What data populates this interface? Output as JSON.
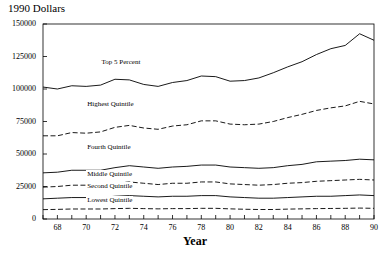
{
  "chart_data": {
    "type": "line",
    "title": "",
    "ylabel": "1990 Dollars",
    "xlabel": "Year",
    "xlim": [
      67,
      90
    ],
    "ylim": [
      0,
      150000
    ],
    "grid": false,
    "legend_position": "inline-labels",
    "xticks": [
      "68",
      "70",
      "72",
      "74",
      "76",
      "78",
      "80",
      "82",
      "84",
      "86",
      "88",
      "90"
    ],
    "xtick_values": [
      68,
      70,
      72,
      74,
      76,
      78,
      80,
      82,
      84,
      86,
      88,
      90
    ],
    "yticks": [
      "0",
      "25000",
      "50000",
      "75000",
      "100000",
      "125000",
      "150000"
    ],
    "ytick_values": [
      0,
      25000,
      50000,
      75000,
      100000,
      125000,
      150000
    ],
    "x": [
      67,
      68,
      69,
      70,
      71,
      72,
      73,
      74,
      75,
      76,
      77,
      78,
      79,
      80,
      81,
      82,
      83,
      84,
      85,
      86,
      87,
      88,
      89,
      90
    ],
    "series": [
      {
        "name": "Top 5 Percent",
        "style": "solid",
        "color": "#000000",
        "label_x": 71,
        "label_y": 120000,
        "values": [
          101500,
          100000,
          102500,
          102000,
          103000,
          107500,
          107000,
          103500,
          102000,
          105000,
          106500,
          110000,
          109500,
          106000,
          106500,
          108500,
          112500,
          117000,
          121000,
          126500,
          131000,
          133500,
          142500,
          137500
        ]
      },
      {
        "name": "Highest Quintile",
        "style": "dashed",
        "color": "#000000",
        "label_x": 70,
        "label_y": 88000,
        "values": [
          64000,
          64000,
          66500,
          66000,
          67000,
          70500,
          72000,
          70000,
          69000,
          71500,
          72500,
          75500,
          75500,
          73000,
          72500,
          73000,
          75000,
          78000,
          80500,
          83500,
          85500,
          87000,
          90500,
          88500
        ]
      },
      {
        "name": "Fourth Quintile",
        "style": "solid",
        "color": "#000000",
        "label_x": 70,
        "label_y": 55000,
        "values": [
          35500,
          36000,
          37500,
          37500,
          37500,
          39500,
          41000,
          40000,
          39000,
          40000,
          40500,
          41500,
          41500,
          40000,
          39500,
          39000,
          39500,
          41000,
          42000,
          44000,
          44500,
          45000,
          46000,
          45500
        ]
      },
      {
        "name": "Middle Quintile",
        "style": "dashed",
        "color": "#000000",
        "label_x": 70,
        "label_y": 33500,
        "values": [
          24500,
          25000,
          26000,
          26000,
          26000,
          27500,
          28500,
          27500,
          26500,
          27500,
          27500,
          28500,
          28500,
          27000,
          26500,
          26000,
          26500,
          27500,
          28000,
          29000,
          29500,
          30000,
          30500,
          30000
        ]
      },
      {
        "name": "Second Quintile",
        "style": "solid",
        "color": "#000000",
        "label_x": 70,
        "label_y": 25000,
        "values": [
          15500,
          16000,
          16500,
          16500,
          16500,
          17500,
          18000,
          17500,
          17000,
          17500,
          17500,
          18000,
          18000,
          17000,
          16500,
          16000,
          16000,
          16500,
          17000,
          17500,
          17500,
          18000,
          18500,
          18000
        ]
      },
      {
        "name": "Lowest Quintile",
        "style": "dashed",
        "color": "#000000",
        "label_x": 70,
        "label_y": 13500,
        "values": [
          7200,
          7400,
          7700,
          7700,
          7700,
          8000,
          8200,
          8000,
          7800,
          8000,
          8000,
          8200,
          8200,
          7800,
          7500,
          7300,
          7300,
          7600,
          7800,
          8000,
          8100,
          8200,
          8400,
          8200
        ]
      }
    ]
  },
  "plot": {
    "left": 43,
    "top": 24,
    "right": 374,
    "bottom": 219
  }
}
